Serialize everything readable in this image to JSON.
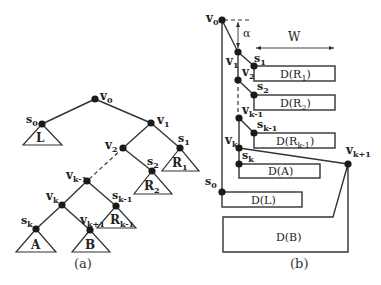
{
  "figure_a": {
    "caption": "(a)",
    "nodes": {
      "v0": {
        "label": "v",
        "sub": "0"
      },
      "v1": {
        "label": "v",
        "sub": "1"
      },
      "v2": {
        "label": "v",
        "sub": "2"
      },
      "vk_1": {
        "label": "v",
        "sub": "k-1"
      },
      "vk": {
        "label": "v",
        "sub": "k"
      },
      "vk1": {
        "label": "v",
        "sub": "k+1"
      },
      "s0": {
        "label": "s",
        "sub": "0"
      },
      "s1": {
        "label": "s",
        "sub": "1"
      },
      "s2": {
        "label": "s",
        "sub": "2"
      },
      "sk_1": {
        "label": "s",
        "sub": "k-1"
      },
      "sk": {
        "label": "s",
        "sub": "k"
      }
    },
    "subtrees": {
      "L": {
        "label": "L",
        "sub": ""
      },
      "R1": {
        "label": "R",
        "sub": "1"
      },
      "R2": {
        "label": "R",
        "sub": "2"
      },
      "Rk_1": {
        "label": "R",
        "sub": "k-1"
      },
      "A": {
        "label": "A",
        "sub": ""
      },
      "B": {
        "label": "B",
        "sub": ""
      }
    }
  },
  "figure_b": {
    "caption": "(b)",
    "alpha": "α",
    "width_label": "W",
    "nodes": {
      "v0": {
        "label": "v",
        "sub": "0"
      },
      "v1": {
        "label": "v",
        "sub": "1"
      },
      "v2": {
        "label": "v",
        "sub": "2"
      },
      "vk_1": {
        "label": "v",
        "sub": "k-1"
      },
      "vk": {
        "label": "v",
        "sub": "k"
      },
      "vk1": {
        "label": "v",
        "sub": "k+1"
      },
      "s0": {
        "label": "s",
        "sub": "0"
      },
      "s1": {
        "label": "s",
        "sub": "1"
      },
      "s2": {
        "label": "s",
        "sub": "2"
      },
      "sk_1": {
        "label": "s",
        "sub": "k-1"
      },
      "sk": {
        "label": "s",
        "sub": "k"
      }
    },
    "boxes": {
      "DR1": {
        "pre": "D(R",
        "sub": "1",
        "post": ")"
      },
      "DR2": {
        "pre": "D(R",
        "sub": "2",
        "post": ")"
      },
      "DRk_1": {
        "pre": "D(R",
        "sub": "k-1",
        "post": ")"
      },
      "DA": {
        "pre": "D(A)",
        "sub": "",
        "post": ""
      },
      "DL": {
        "pre": "D(L)",
        "sub": "",
        "post": ""
      },
      "DB": {
        "pre": "D(B)",
        "sub": "",
        "post": ""
      }
    }
  }
}
